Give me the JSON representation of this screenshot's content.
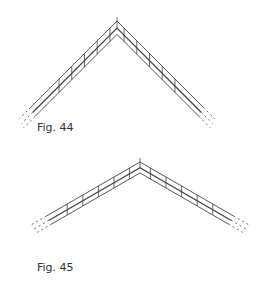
{
  "figures": [
    {
      "id": "fig44",
      "caption": "Fig. 44",
      "description": "Chevron of three parallel rails meeting at an apex with cross ties, steep angle, dashed ends"
    },
    {
      "id": "fig45",
      "caption": "Fig. 45",
      "description": "Chevron of three parallel rails meeting at an apex with cross ties, shallow angle, dashed ends"
    }
  ],
  "colors": {
    "line": "#444444",
    "background": "#ffffff"
  }
}
